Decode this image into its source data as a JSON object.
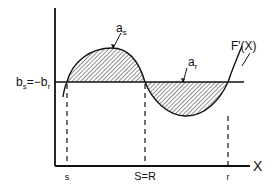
{
  "diagram": {
    "type": "function-plot",
    "curve_label": "F'(X)",
    "x_axis_label": "X",
    "y_level_label": "b",
    "y_level_label_sub_s": "s",
    "y_level_label_eq": "=−b",
    "y_level_label_sub_r": "r",
    "area_positive_label": "a",
    "area_positive_sub": "s",
    "area_negative_label": "a",
    "area_negative_sub": "r",
    "x_ticks": [
      {
        "label": "s"
      },
      {
        "label": "S=R"
      },
      {
        "label": "r"
      }
    ],
    "colors": {
      "line": "#111111",
      "hatch": "#222222",
      "background": "#ffffff"
    }
  }
}
